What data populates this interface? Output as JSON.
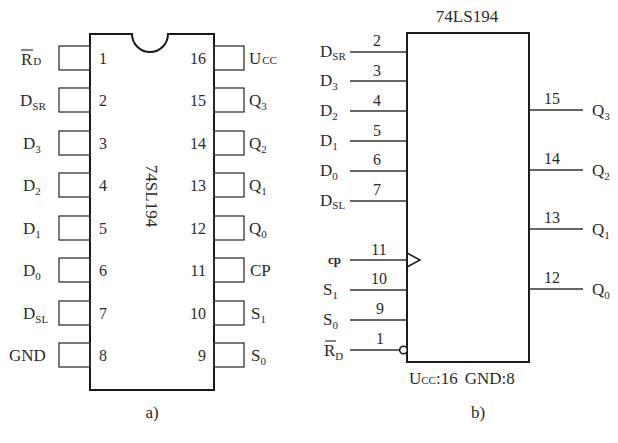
{
  "figure": {
    "left_caption": "a)",
    "right_caption": "b)"
  },
  "dip_package": {
    "chip_label": "74SL194",
    "left_pins": [
      {
        "num": "1",
        "name": "R",
        "sub": "D",
        "overbar": true
      },
      {
        "num": "2",
        "name": "D",
        "sub": "SR"
      },
      {
        "num": "3",
        "name": "D",
        "sub": "3"
      },
      {
        "num": "4",
        "name": "D",
        "sub": "2"
      },
      {
        "num": "5",
        "name": "D",
        "sub": "1"
      },
      {
        "num": "6",
        "name": "D",
        "sub": "0"
      },
      {
        "num": "7",
        "name": "D",
        "sub": "SL"
      },
      {
        "num": "8",
        "name": "GND",
        "sub": ""
      }
    ],
    "right_pins": [
      {
        "num": "16",
        "name": "U",
        "sub": "CC"
      },
      {
        "num": "15",
        "name": "Q",
        "sub": "3"
      },
      {
        "num": "14",
        "name": "Q",
        "sub": "2"
      },
      {
        "num": "13",
        "name": "Q",
        "sub": "1"
      },
      {
        "num": "12",
        "name": "Q",
        "sub": "0"
      },
      {
        "num": "11",
        "name": "CP",
        "sub": ""
      },
      {
        "num": "10",
        "name": "S",
        "sub": "1"
      },
      {
        "num": "9",
        "name": "S",
        "sub": "0"
      }
    ]
  },
  "logic_symbol": {
    "title": "74LS194",
    "inputs": [
      {
        "num": "2",
        "name": "D",
        "sub": "SR"
      },
      {
        "num": "3",
        "name": "D",
        "sub": "3"
      },
      {
        "num": "4",
        "name": "D",
        "sub": "2"
      },
      {
        "num": "5",
        "name": "D",
        "sub": "1"
      },
      {
        "num": "6",
        "name": "D",
        "sub": "0"
      },
      {
        "num": "7",
        "name": "D",
        "sub": "SL"
      },
      {
        "num": "11",
        "name": "cp",
        "sub": "",
        "clock": true
      },
      {
        "num": "10",
        "name": "S",
        "sub": "1"
      },
      {
        "num": "9",
        "name": "S",
        "sub": "0"
      },
      {
        "num": "1",
        "name": "R",
        "sub": "D",
        "overbar": true,
        "inverted": true
      }
    ],
    "outputs": [
      {
        "num": "15",
        "name": "Q",
        "sub": "3"
      },
      {
        "num": "14",
        "name": "Q",
        "sub": "2"
      },
      {
        "num": "13",
        "name": "Q",
        "sub": "1"
      },
      {
        "num": "12",
        "name": "Q",
        "sub": "0"
      }
    ],
    "power_note": {
      "ucc": "U",
      "ucc_sub": "CC",
      "ucc_rest": ":16",
      "gnd": "GND:8"
    }
  }
}
